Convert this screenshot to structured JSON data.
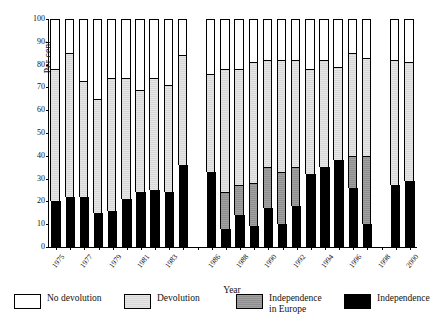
{
  "chart_data": {
    "type": "bar",
    "stacked": true,
    "title": "",
    "xlabel": "Year",
    "ylabel": "Per cent",
    "ylim": [
      0,
      100
    ],
    "ytick_step": 10,
    "yticks": [
      0,
      10,
      20,
      30,
      40,
      50,
      60,
      70,
      80,
      90,
      100
    ],
    "grid": false,
    "legend_position": "below",
    "categories": [
      "1975",
      "1976",
      "1977",
      "1978",
      "1979",
      "1980",
      "1981",
      "1982",
      "1983",
      "1984",
      "1986",
      "1987",
      "1988",
      "1989",
      "1990",
      "1991",
      "1992",
      "1993",
      "1994",
      "1995",
      "1996",
      "1997",
      "1999",
      "2000"
    ],
    "xtick_labels": [
      "1975",
      "1977",
      "1979",
      "1981",
      "1983",
      "1986",
      "1988",
      "1990",
      "1992",
      "1994",
      "1996",
      "1998",
      "2000"
    ],
    "missing_years": [
      "1985",
      "1998"
    ],
    "series": [
      {
        "name": "Independence",
        "color": "#000000",
        "values": [
          20,
          22,
          22,
          15,
          16,
          21,
          24,
          25,
          24,
          36,
          33,
          8,
          14,
          9,
          17,
          10,
          18,
          32,
          35,
          38,
          26,
          10,
          27,
          29
        ]
      },
      {
        "name": "Independence in Europe",
        "color": "#8f8f8f",
        "values": [
          0,
          0,
          0,
          0,
          0,
          0,
          0,
          0,
          0,
          0,
          0,
          16,
          13,
          19,
          18,
          23,
          17,
          0,
          0,
          0,
          14,
          30,
          0,
          0
        ]
      },
      {
        "name": "Devolution",
        "color": "#d8d8d8",
        "values": [
          58,
          63,
          51,
          50,
          58,
          53,
          45,
          49,
          47,
          48,
          43,
          54,
          51,
          53,
          47,
          49,
          47,
          46,
          47,
          41,
          45,
          43,
          55,
          52
        ]
      },
      {
        "name": "No devolution",
        "color": "#ffffff",
        "values": [
          22,
          15,
          27,
          35,
          26,
          26,
          31,
          26,
          29,
          16,
          24,
          22,
          22,
          19,
          18,
          18,
          18,
          22,
          18,
          21,
          15,
          17,
          18,
          19
        ]
      }
    ]
  },
  "legend": {
    "items": [
      {
        "label": "No devolution",
        "swatch": "sw-nodevolution"
      },
      {
        "label": "Devolution",
        "swatch": "sw-devolution"
      },
      {
        "label": "Independence\nin Europe",
        "swatch": "sw-independence-europe"
      },
      {
        "label": "Independence",
        "swatch": "sw-independence"
      }
    ]
  },
  "axes": {
    "y_title": "Per cent",
    "x_title": "Year"
  }
}
